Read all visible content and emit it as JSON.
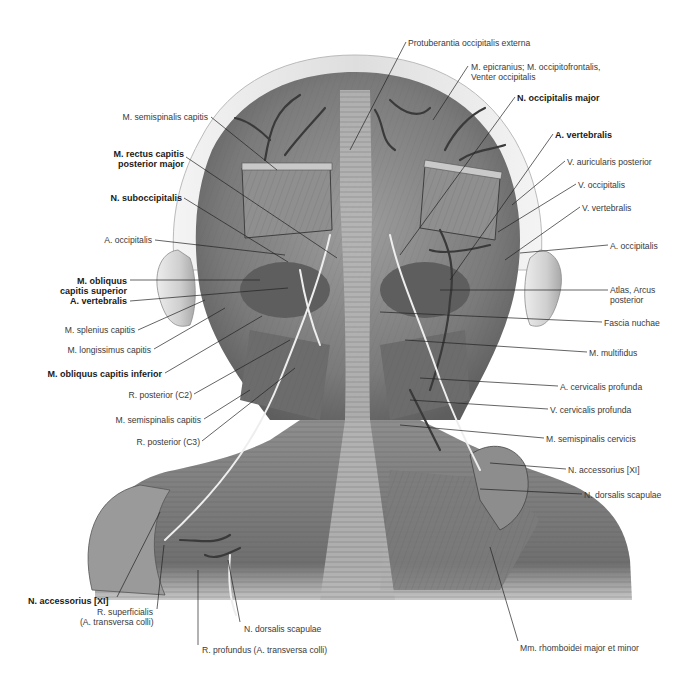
{
  "figure": {
    "style": "grayscale anatomical illustration",
    "colors": {
      "background": "#ffffff",
      "ink": "#3a3a3a",
      "bold_ink": "#1a1a1a",
      "leader": "#222222",
      "skin": "#d9d9d9",
      "muscle": "#8a8a8a",
      "vessel": "#3c3c3c",
      "nerve": "#f2f2f2"
    }
  },
  "labels": [
    {
      "id": "protuberantia",
      "text": "Protuberantia occipitalis externa",
      "bold": false,
      "x": 408,
      "y": 38,
      "align": "left",
      "leader": [
        [
          406,
          42
        ],
        [
          350,
          150
        ]
      ]
    },
    {
      "id": "epicranius",
      "text": "M. epicranius; M. occipitofrontalis,",
      "text2": "Venter occipitalis",
      "bold": false,
      "x": 471,
      "y": 62,
      "align": "left",
      "leader": [
        [
          468,
          66
        ],
        [
          433,
          120
        ]
      ]
    },
    {
      "id": "occipitalis-major",
      "text": "N. occipitalis major",
      "bold": true,
      "x": 517,
      "y": 93,
      "align": "left",
      "leader": [
        [
          515,
          97
        ],
        [
          400,
          255
        ]
      ]
    },
    {
      "id": "vertebralis-a-right",
      "text": "A. vertebralis",
      "bold": true,
      "x": 555,
      "y": 130,
      "align": "left",
      "leader": [
        [
          553,
          134
        ],
        [
          450,
          280
        ]
      ]
    },
    {
      "id": "auricularis-posterior",
      "text": "V. auricularis posterior",
      "bold": false,
      "x": 567,
      "y": 157,
      "align": "left",
      "leader": [
        [
          565,
          161
        ],
        [
          512,
          205
        ]
      ]
    },
    {
      "id": "v-occipitalis",
      "text": "V. occipitalis",
      "bold": false,
      "x": 578,
      "y": 180,
      "align": "left",
      "leader": [
        [
          576,
          184
        ],
        [
          498,
          232
        ]
      ]
    },
    {
      "id": "v-vertebralis",
      "text": "V. vertebralis",
      "bold": false,
      "x": 582,
      "y": 203,
      "align": "left",
      "leader": [
        [
          580,
          207
        ],
        [
          505,
          260
        ]
      ]
    },
    {
      "id": "a-occipitalis-right",
      "text": "A. occipitalis",
      "bold": false,
      "x": 610,
      "y": 241,
      "align": "left",
      "leader": [
        [
          608,
          245
        ],
        [
          520,
          253
        ]
      ]
    },
    {
      "id": "atlas",
      "text": "Atlas, Arcus",
      "text2": "posterior",
      "bold": false,
      "x": 610,
      "y": 285,
      "align": "left",
      "leader": [
        [
          608,
          290
        ],
        [
          440,
          290
        ]
      ]
    },
    {
      "id": "fascia-nuchae",
      "text": "Fascia nuchae",
      "bold": false,
      "x": 604,
      "y": 318,
      "align": "left",
      "leader": [
        [
          602,
          322
        ],
        [
          380,
          312
        ]
      ]
    },
    {
      "id": "multifidus",
      "text": "M. multifidus",
      "bold": false,
      "x": 589,
      "y": 348,
      "align": "left",
      "leader": [
        [
          587,
          352
        ],
        [
          405,
          340
        ]
      ]
    },
    {
      "id": "cervicalis-a",
      "text": "A. cervicalis profunda",
      "bold": false,
      "x": 560,
      "y": 382,
      "align": "left",
      "leader": [
        [
          558,
          386
        ],
        [
          420,
          378
        ]
      ]
    },
    {
      "id": "cervicalis-v",
      "text": "V. cervicalis profunda",
      "bold": false,
      "x": 550,
      "y": 405,
      "align": "left",
      "leader": [
        [
          548,
          409
        ],
        [
          410,
          400
        ]
      ]
    },
    {
      "id": "semispinalis-cervicis",
      "text": "M. semispinalis cervicis",
      "bold": false,
      "x": 546,
      "y": 434,
      "align": "left",
      "leader": [
        [
          544,
          438
        ],
        [
          400,
          425
        ]
      ]
    },
    {
      "id": "accessorius-right",
      "text": "N. accessorius [XI]",
      "bold": false,
      "x": 568,
      "y": 465,
      "align": "left",
      "leader": [
        [
          566,
          469
        ],
        [
          490,
          463
        ]
      ]
    },
    {
      "id": "dorsalis-scapulae-right",
      "text": "N. dorsalis scapulae",
      "bold": false,
      "x": 584,
      "y": 490,
      "align": "left",
      "leader": [
        [
          582,
          494
        ],
        [
          480,
          489
        ]
      ]
    },
    {
      "id": "rhomboidei",
      "text": "Mm. rhomboidei major et minor",
      "bold": false,
      "x": 520,
      "y": 643,
      "align": "left",
      "leader": [
        [
          518,
          641
        ],
        [
          490,
          547
        ]
      ]
    },
    {
      "id": "semispinalis-capitis-top",
      "text": "M. semispinalis capitis",
      "bold": false,
      "x": 120,
      "y": 112,
      "align": "right",
      "w": 88,
      "leader": [
        [
          211,
          117
        ],
        [
          277,
          170
        ]
      ]
    },
    {
      "id": "rectus-capitis",
      "text": "M. rectus capitis",
      "text2": "posterior major",
      "bold": true,
      "x": 108,
      "y": 149,
      "align": "right",
      "w": 76,
      "leader": [
        [
          186,
          157
        ],
        [
          337,
          258
        ]
      ]
    },
    {
      "id": "suboccipitalis",
      "text": "N. suboccipitalis",
      "bold": true,
      "x": 98,
      "y": 193,
      "align": "right",
      "w": 84,
      "leader": [
        [
          184,
          198
        ],
        [
          288,
          262
        ]
      ]
    },
    {
      "id": "a-occipitalis-left",
      "text": "A. occipitalis",
      "bold": false,
      "x": 100,
      "y": 235,
      "align": "right",
      "w": 52,
      "leader": [
        [
          155,
          240
        ],
        [
          285,
          255
        ]
      ]
    },
    {
      "id": "obliquus-superior",
      "text": "M. obliquus",
      "text2": "capitis superior",
      "bold": true,
      "x": 52,
      "y": 276,
      "align": "right",
      "w": 75,
      "leader": [
        [
          130,
          280
        ],
        [
          260,
          280
        ]
      ]
    },
    {
      "id": "vertebralis-a-left",
      "text": "A. vertebralis",
      "bold": true,
      "x": 64,
      "y": 296,
      "align": "right",
      "w": 63,
      "leader": [
        [
          130,
          301
        ],
        [
          288,
          288
        ]
      ]
    },
    {
      "id": "splenius",
      "text": "M. splenius capitis",
      "bold": false,
      "x": 62,
      "y": 325,
      "align": "right",
      "w": 73,
      "leader": [
        [
          138,
          330
        ],
        [
          205,
          300
        ]
      ]
    },
    {
      "id": "longissimus",
      "text": "M. longissimus capitis",
      "bold": false,
      "x": 64,
      "y": 345,
      "align": "right",
      "w": 87,
      "leader": [
        [
          154,
          349
        ],
        [
          225,
          308
        ]
      ]
    },
    {
      "id": "obliquus-inferior",
      "text": "M. obliquus capitis inferior",
      "bold": true,
      "x": 42,
      "y": 369,
      "align": "right",
      "w": 120,
      "leader": [
        [
          165,
          373
        ],
        [
          262,
          316
        ]
      ]
    },
    {
      "id": "r-posterior-c2",
      "text": "R. posterior (C2)",
      "bold": false,
      "x": 128,
      "y": 390,
      "align": "right",
      "w": 64,
      "leader": [
        [
          194,
          394
        ],
        [
          290,
          340
        ]
      ]
    },
    {
      "id": "semispinalis-capitis-low",
      "text": "M. semispinalis capitis",
      "bold": false,
      "x": 112,
      "y": 415,
      "align": "right",
      "w": 89,
      "leader": [
        [
          204,
          419
        ],
        [
          250,
          390
        ]
      ]
    },
    {
      "id": "r-posterior-c3",
      "text": "R. posterior (C3)",
      "bold": false,
      "x": 136,
      "y": 437,
      "align": "right",
      "w": 64,
      "leader": [
        [
          202,
          441
        ],
        [
          295,
          368
        ]
      ]
    },
    {
      "id": "accessorius-left",
      "text": "N. accessorius [XI]",
      "bold": true,
      "x": 28,
      "y": 596,
      "align": "left",
      "leader": [
        [
          117,
          597
        ],
        [
          160,
          512
        ]
      ]
    },
    {
      "id": "r-superficialis",
      "text": "R. superficialis",
      "text2": "(A. transversa colli)",
      "bold": false,
      "x": 80,
      "y": 607,
      "align": "right",
      "w": 73,
      "leader": [
        [
          157,
          609
        ],
        [
          164,
          545
        ]
      ]
    },
    {
      "id": "dorsalis-scapulae-left",
      "text": "N. dorsalis scapulae",
      "bold": false,
      "x": 244,
      "y": 624,
      "align": "left",
      "leader": [
        [
          240,
          622
        ],
        [
          228,
          560
        ]
      ]
    },
    {
      "id": "r-profundus",
      "text": "R. profundus (A. transversa colli)",
      "bold": false,
      "x": 202,
      "y": 645,
      "align": "left",
      "leader": [
        [
          198,
          645
        ],
        [
          198,
          570
        ]
      ]
    }
  ]
}
